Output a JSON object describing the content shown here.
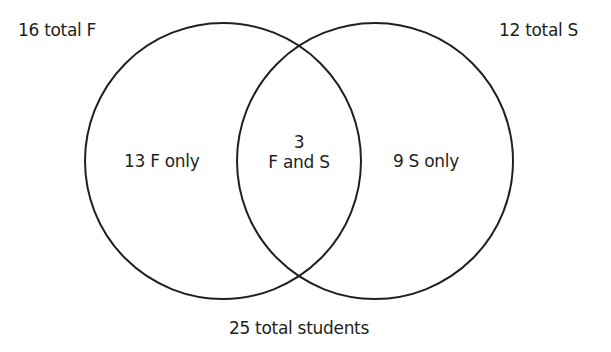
{
  "diagram": {
    "type": "venn",
    "sets": [
      {
        "name": "F",
        "total_label": "16 total F",
        "only_label": "13 F only",
        "total": 16,
        "only": 13
      },
      {
        "name": "S",
        "total_label": "12 total S",
        "only_label": "9 S only",
        "total": 12,
        "only": 9
      }
    ],
    "intersection": {
      "count_label": "3",
      "label": "F and S",
      "count": 3
    },
    "universe_label": "25 total students",
    "universe_total": 25,
    "stroke_color": "#231f20"
  }
}
